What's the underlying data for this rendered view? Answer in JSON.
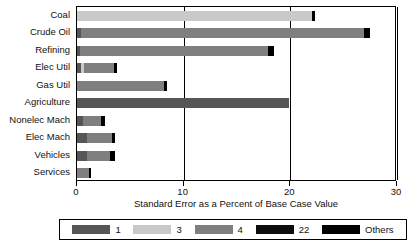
{
  "chart_data": {
    "type": "bar",
    "orientation": "horizontal",
    "stacked": true,
    "title": "",
    "xlabel": "Standard Error as a Percent of Base Case Value",
    "ylabel": "",
    "xlim": [
      0,
      30
    ],
    "xticks": [
      0,
      10,
      20,
      30
    ],
    "xtick_labels": [
      "0",
      "10",
      "20",
      "30"
    ],
    "grid": true,
    "legend_position": "bottom",
    "categories": [
      "Coal",
      "Crude Oil",
      "Refining",
      "Elec Util",
      "Gas Util",
      "Agriculture",
      "Nonelec Mach",
      "Elec Mach",
      "Vehicles",
      "Services"
    ],
    "series": [
      {
        "name": "1",
        "color": "#565656",
        "values": [
          0.0,
          0.35,
          0.3,
          0.35,
          0.0,
          19.9,
          0.55,
          0.95,
          0.95,
          0.0
        ]
      },
      {
        "name": "3",
        "color": "#c9c9c9",
        "values": [
          22.0,
          0.0,
          0.0,
          0.3,
          0.0,
          0.0,
          0.0,
          0.0,
          0.0,
          0.0
        ]
      },
      {
        "name": "4",
        "color": "#7f7f7f",
        "values": [
          0.0,
          26.6,
          17.6,
          2.8,
          8.2,
          0.0,
          1.7,
          2.3,
          2.1,
          1.15
        ]
      },
      {
        "name": "22",
        "color": "#0d0d0d",
        "values": [
          0.0,
          0.0,
          0.0,
          0.0,
          0.0,
          0.0,
          0.0,
          0.0,
          0.0,
          0.0
        ]
      },
      {
        "name": "Others",
        "color": "#000000",
        "values": [
          0.35,
          0.5,
          0.55,
          0.3,
          0.25,
          0.0,
          0.4,
          0.35,
          0.5,
          0.2
        ]
      }
    ],
    "totals": [
      22.35,
      27.45,
      18.45,
      3.75,
      8.45,
      19.9,
      2.65,
      3.6,
      3.55,
      1.35
    ]
  },
  "axis": {
    "x_title": "Standard Error as a Percent of Base Case Value",
    "tick_labels": [
      "0",
      "10",
      "20",
      "30"
    ]
  },
  "legend": {
    "items": [
      {
        "label": "1",
        "color": "#565656"
      },
      {
        "label": "3",
        "color": "#c9c9c9"
      },
      {
        "label": "4",
        "color": "#7f7f7f"
      },
      {
        "label": "22",
        "color": "#0d0d0d"
      },
      {
        "label": "Others",
        "color": "#000000"
      }
    ]
  }
}
